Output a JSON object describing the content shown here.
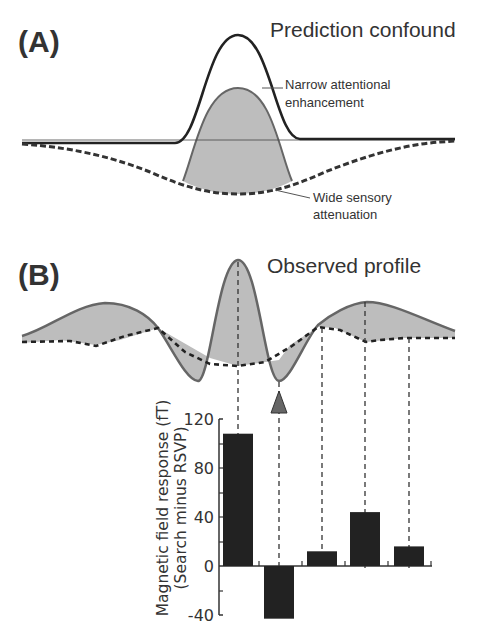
{
  "panel_a": {
    "label": "(A)",
    "title": "Prediction confound",
    "annotation_narrow": [
      "Narrow attentional",
      "enhancement"
    ],
    "annotation_wide": [
      "Wide sensory",
      "attenuation"
    ]
  },
  "panel_b": {
    "label": "(B)",
    "title": "Observed profile"
  },
  "chart_data": [
    {
      "type": "line",
      "title": "Prediction confound",
      "panel": "(A)",
      "series": [
        {
          "name": "Narrow attentional enhancement",
          "style": "solid",
          "shape": "narrow positive gaussian"
        },
        {
          "name": "Wide sensory attenuation",
          "style": "dashed",
          "shape": "wide negative gaussian"
        },
        {
          "name": "Sum (shaded)",
          "style": "filled gray",
          "shape": "narrow peak over wide trough"
        }
      ],
      "xlabel": "",
      "ylabel": ""
    },
    {
      "type": "line",
      "title": "Observed profile",
      "panel": "(B)",
      "series": [
        {
          "name": "Observed profile",
          "style": "solid gray with gray fill"
        },
        {
          "name": "Baseline",
          "style": "dashed"
        }
      ],
      "annotations": [
        "triangle marker at trough next to central peak"
      ]
    },
    {
      "type": "bar",
      "categories": [
        "1",
        "2",
        "3",
        "4",
        "5"
      ],
      "values": [
        108,
        -43,
        12,
        44,
        16
      ],
      "title": "",
      "xlabel": "",
      "ylabel": "Magnetic field response (fT) (Search minus RSVP)",
      "ylabel_lines": [
        "Magnetic field response (fT)",
        "(Search minus RSVP)"
      ],
      "yticks": [
        120,
        80,
        40,
        0,
        -40
      ],
      "ylim": [
        -40,
        120
      ],
      "bar_color": "#222222",
      "annotations": [
        "triangle marker above bar 2"
      ]
    }
  ],
  "colors": {
    "curve_dark": "#222222",
    "curve_gray": "#666666",
    "fill_gray": "#bdbdbd",
    "bar": "#222222",
    "triangle": "#666666"
  }
}
